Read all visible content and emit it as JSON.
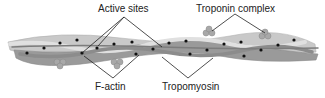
{
  "diagram": {
    "labels": {
      "active_sites": "Active sites",
      "troponin_complex": "Troponin complex",
      "f_actin": "F-actin",
      "tropomyosin": "Tropomyosin"
    },
    "colors": {
      "actin_light": "#c9c9c9",
      "actin_dark": "#9a9a9a",
      "tropomyosin": "#7d7d7d",
      "troponin": "#a8a8a8",
      "active_site_dot": "#111111",
      "leader_line": "#222222",
      "background": "#ffffff"
    },
    "components": [
      "F-actin strands",
      "Tropomyosin",
      "Troponin complex",
      "Active sites"
    ]
  }
}
